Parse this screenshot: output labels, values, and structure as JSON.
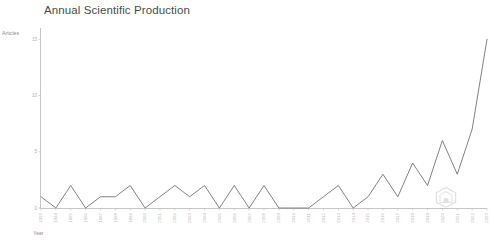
{
  "chart": {
    "title": "Annual Scientific Production",
    "ylabel": "Articles",
    "xlabel": "Year",
    "watermark_icon": "hexagon-house-logo"
  },
  "chart_data": {
    "type": "line",
    "title": "Annual Scientific Production",
    "xlabel": "Year",
    "ylabel": "Articles",
    "grid": false,
    "legend": null,
    "line_color": "#6b6b6b",
    "xlim": [
      1993,
      2023
    ],
    "ylim": [
      0,
      16
    ],
    "yticks": [
      0,
      5,
      10,
      15
    ],
    "ytick_labels": [
      "0",
      "5",
      "10",
      "15"
    ],
    "categories": [
      "1993",
      "1994",
      "1995",
      "1996",
      "1997",
      "1998",
      "1999",
      "2000",
      "2001",
      "2002",
      "2003",
      "2004",
      "2005",
      "2006",
      "2007",
      "2008",
      "2009",
      "2010",
      "2011",
      "2012",
      "2013",
      "2014",
      "2015",
      "2016",
      "2017",
      "2018",
      "2019",
      "2020",
      "2021",
      "2022",
      "2023"
    ],
    "values": [
      1,
      0,
      2,
      0,
      1,
      1,
      2,
      0,
      1,
      2,
      1,
      2,
      0,
      2,
      0,
      2,
      0,
      0,
      0,
      1,
      2,
      0,
      1,
      3,
      1,
      4,
      2,
      6,
      3,
      7,
      15
    ],
    "x": [
      1993,
      1994,
      1995,
      1996,
      1997,
      1998,
      1999,
      2000,
      2001,
      2002,
      2003,
      2004,
      2005,
      2006,
      2007,
      2008,
      2009,
      2010,
      2011,
      2012,
      2013,
      2014,
      2015,
      2016,
      2017,
      2018,
      2019,
      2020,
      2021,
      2022,
      2023
    ],
    "series": [
      {
        "name": "Articles",
        "values": [
          1,
          0,
          2,
          0,
          1,
          1,
          2,
          0,
          1,
          2,
          1,
          2,
          0,
          2,
          0,
          2,
          0,
          0,
          0,
          1,
          2,
          0,
          1,
          3,
          1,
          4,
          2,
          6,
          3,
          7,
          15
        ]
      }
    ]
  }
}
